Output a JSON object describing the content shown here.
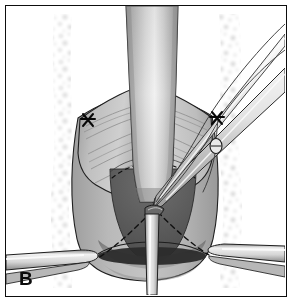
{
  "figure": {
    "panel_label": "B",
    "frame": {
      "border_color": "#0d0d0d",
      "background_color": "#ffffff",
      "margin_px": 5
    }
  },
  "palette": {
    "outline": "#1a1a1a",
    "dashed_line": "#111111",
    "background": "#ffffff",
    "speckle": "#d7d7d7",
    "tissue_light": "#d2d2d2",
    "tissue_mid": "#b4b4b4",
    "tissue_dark": "#8e8e8e",
    "cavity_dark": "#5a5a5a",
    "cavity_darker": "#3f3f3f",
    "rim_band": "#2e2e2e",
    "column_highlight": "#f2f2f2",
    "column_shadow": "#9a9a9a",
    "instrument_light": "#ededed",
    "instrument_shadow": "#a8a8a8",
    "suture_marker": "#0a0a0a"
  },
  "anatomy": {
    "central_column": {
      "name": "central-vertical-column",
      "label": "midline tubular structure",
      "top_y": 8,
      "bottom_y": 200,
      "top_width": 52,
      "bottom_width": 44
    },
    "left_flap": {
      "name": "left-tissue-flap",
      "label": "left retracted tissue flap",
      "striation_count": 5
    },
    "right_flap": {
      "name": "right-tissue-flap",
      "label": "right retracted tissue flap",
      "striation_count": 5
    },
    "cavity": {
      "name": "central-cavity",
      "label": "dark triangular cavity",
      "apex_x": 147,
      "apex_y": 205
    },
    "rim_band": {
      "name": "inferior-rim-band",
      "label": "dark elliptical inferior rim",
      "center_x": 146,
      "center_y": 253
    }
  },
  "markers": {
    "left_suture": {
      "name": "left-suture-anchor",
      "label": "left suture anchor",
      "x": 82,
      "y": 114
    },
    "right_suture": {
      "name": "right-suture-anchor",
      "label": "right suture anchor",
      "x": 211,
      "y": 112
    },
    "knot": {
      "name": "suture-knot-bead",
      "label": "suture knot",
      "x": 210,
      "y": 140,
      "rx": 6,
      "ry": 7
    }
  },
  "instruments": {
    "upper_right_shaft": {
      "name": "upper-right-instrument-shaft",
      "label": "instrument shaft from upper right"
    },
    "suture_strands": {
      "name": "suture-strands",
      "label": "suture strands",
      "count": 3
    },
    "lower_left_retractor": {
      "name": "lower-left-retractor",
      "label": "left retractor blade",
      "tip_x": 92,
      "tip_y": 256
    },
    "lower_right_retractor": {
      "name": "lower-right-retractor",
      "label": "right retractor blade",
      "tip_x": 206,
      "tip_y": 250
    },
    "central_probe": {
      "name": "central-vertical-probe",
      "label": "vertical probe / catheter",
      "top_y": 212,
      "bottom_y": 292
    },
    "converging_tip": {
      "name": "instrument-tip",
      "label": "instrument tip at cavity apex",
      "x": 150,
      "y": 206
    }
  }
}
